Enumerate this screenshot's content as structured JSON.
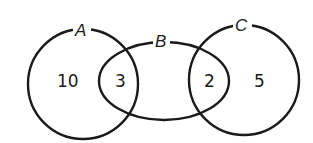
{
  "diagram": {
    "type": "venn",
    "sets": [
      {
        "name": "A",
        "shape": "circle"
      },
      {
        "name": "B",
        "shape": "ellipse"
      },
      {
        "name": "C",
        "shape": "circle"
      }
    ],
    "regions": {
      "A_only": "10",
      "A_and_B": "3",
      "B_and_C": "2",
      "C_only": "5"
    },
    "colors": {
      "stroke": "#1a1a1a",
      "background": "#ffffff"
    }
  }
}
